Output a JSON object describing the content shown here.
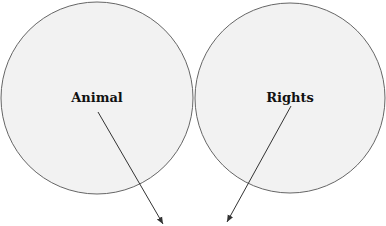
{
  "diagram": {
    "circles": [
      {
        "id": "left",
        "label": "Animal",
        "cx": 97,
        "cy": 98,
        "r": 96
      },
      {
        "id": "right",
        "label": "Rights",
        "cx": 290,
        "cy": 98,
        "r": 96
      }
    ],
    "arrows": [
      {
        "from": [
          98,
          112
        ],
        "to": [
          163,
          224
        ]
      },
      {
        "from": [
          291,
          106
        ],
        "to": [
          227,
          222
        ]
      }
    ],
    "colors": {
      "circle_fill": "#f2f2f2",
      "circle_stroke": "#666666",
      "arrow": "#333333",
      "text": "#111111"
    }
  }
}
